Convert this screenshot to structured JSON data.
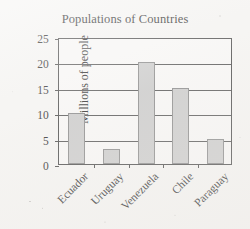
{
  "chart_data": {
    "type": "bar",
    "title": "Populations of Countries",
    "xlabel": "",
    "ylabel": "Millions of people",
    "categories": [
      "Ecuador",
      "Uruguay",
      "Venezuela",
      "Chile",
      "Paraguay"
    ],
    "values": [
      10,
      3,
      20,
      15,
      5
    ],
    "ylim": [
      0,
      25
    ],
    "ytick_labels": [
      "0",
      "5",
      "10",
      "15",
      "20",
      "25"
    ],
    "ytick_values": [
      0,
      5,
      10,
      15,
      20,
      25
    ],
    "grid": true,
    "legend": "none",
    "bar_fill_color": "#cccccc",
    "bar_border_color": "#8a8a8a",
    "axis_color": "#4a4a4a",
    "background_color": "#f6f5f3"
  }
}
